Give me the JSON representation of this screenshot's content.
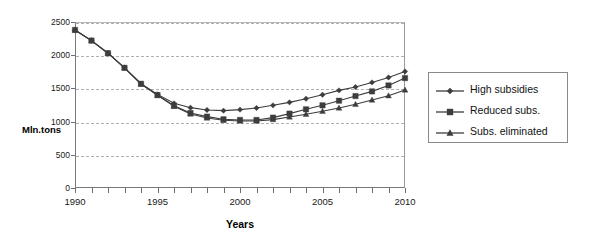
{
  "chart_data": {
    "type": "line",
    "title": "",
    "xlabel": "Years",
    "ylabel": "Mln.tons",
    "xlim": [
      1990,
      2010
    ],
    "ylim": [
      0,
      2500
    ],
    "grid": "horizontal-dashed",
    "legend_position": "right",
    "x": [
      1990,
      1991,
      1992,
      1993,
      1994,
      1995,
      1996,
      1997,
      1998,
      1999,
      2000,
      2001,
      2002,
      2003,
      2004,
      2005,
      2006,
      2007,
      2008,
      2009,
      2010
    ],
    "xticks": [
      1990,
      1995,
      2000,
      2005,
      2010
    ],
    "xtick_labels": [
      "1990",
      "1995",
      "2000",
      "2005",
      "2010"
    ],
    "yticks": [
      0,
      500,
      1000,
      1500,
      2000,
      2500
    ],
    "ytick_labels": [
      "0",
      "500",
      "1000",
      "1500",
      "2000",
      "2500"
    ],
    "series": [
      {
        "name": "High subsidies",
        "marker": "diamond",
        "color": "#3d3d3d",
        "values": [
          2380,
          2220,
          2030,
          1810,
          1570,
          1410,
          1275,
          1210,
          1175,
          1165,
          1180,
          1205,
          1245,
          1290,
          1345,
          1405,
          1470,
          1520,
          1590,
          1665,
          1755
        ]
      },
      {
        "name": "Reduced subs.",
        "marker": "square",
        "color": "#3d3d3d",
        "values": [
          2380,
          2220,
          2030,
          1810,
          1570,
          1400,
          1240,
          1130,
          1075,
          1035,
          1025,
          1025,
          1060,
          1120,
          1185,
          1245,
          1315,
          1385,
          1455,
          1545,
          1655
        ]
      },
      {
        "name": "Subs. eliminated",
        "marker": "triangle",
        "color": "#3d3d3d",
        "values": [
          2380,
          2220,
          2030,
          1810,
          1565,
          1395,
          1230,
          1115,
          1055,
          1020,
          1010,
          1010,
          1030,
          1070,
          1110,
          1155,
          1205,
          1260,
          1325,
          1390,
          1475
        ]
      }
    ]
  },
  "axes": {
    "ylabel": "Mln.tons",
    "xlabel": "Years"
  },
  "legend": {
    "items": [
      {
        "label": "High subsidies",
        "marker": "diamond"
      },
      {
        "label": "Reduced subs.",
        "marker": "square"
      },
      {
        "label": "Subs. eliminated",
        "marker": "triangle"
      }
    ]
  },
  "colors": {
    "series": "#3d3d3d",
    "grid": "#b0b0b0",
    "axis": "#6f6f6f",
    "text": "#1a1a1a"
  }
}
